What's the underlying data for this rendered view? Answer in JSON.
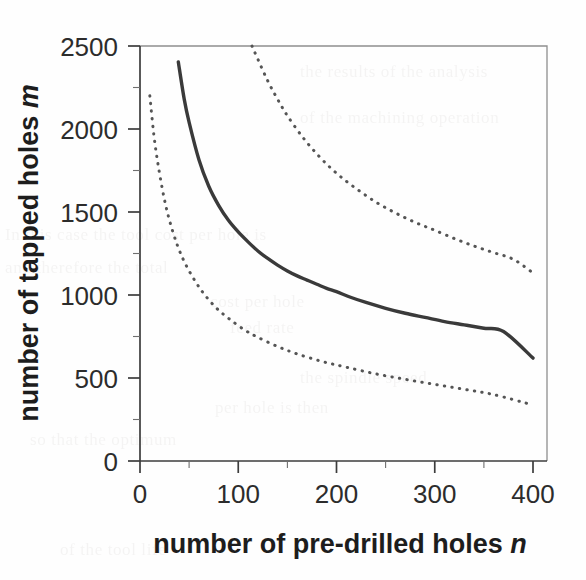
{
  "figure": {
    "name": "tapped-holes-vs-predrilled-holes-plot",
    "background_color": "#fefefe",
    "ink_color": "#3a3a3a"
  },
  "chart_data": {
    "type": "line",
    "title": "",
    "subtitle": "",
    "xlabel_text": "number of pre-drilled holes ",
    "xlabel_variable": "n",
    "ylabel_text": "number of tapped holes ",
    "ylabel_variable": "m",
    "xlim": [
      0,
      400
    ],
    "ylim": [
      0,
      2500
    ],
    "grid": false,
    "legend": "none",
    "x_ticks": [
      0,
      100,
      200,
      300,
      400
    ],
    "x_tick_labels": [
      "0",
      "100",
      "200",
      "300",
      "400"
    ],
    "x_minor_tick_step": 50,
    "y_ticks": [
      0,
      500,
      1000,
      1500,
      2000,
      2500
    ],
    "y_tick_labels": [
      "0",
      "500",
      "1000",
      "1500",
      "2000",
      "2500"
    ],
    "y_minor_tick_step": 250,
    "series": [
      {
        "name": "central estimate",
        "style": "solid",
        "color": "#3a3a3a",
        "x": [
          39,
          45,
          50,
          60,
          70,
          80,
          90,
          100,
          110,
          120,
          130,
          140,
          150,
          160,
          170,
          180,
          190,
          200,
          215,
          230,
          250,
          270,
          290,
          310,
          330,
          350,
          370,
          400
        ],
        "y": [
          2404,
          2180,
          2040,
          1815,
          1655,
          1540,
          1450,
          1380,
          1320,
          1265,
          1220,
          1180,
          1145,
          1115,
          1090,
          1065,
          1040,
          1020,
          985,
          955,
          920,
          890,
          865,
          840,
          820,
          800,
          780,
          620
        ]
      },
      {
        "name": "upper bound",
        "style": "dotted",
        "color": "#555555",
        "x": [
          114,
          120,
          130,
          140,
          150,
          165,
          180,
          195,
          210,
          225,
          240,
          255,
          270,
          285,
          300,
          320,
          340,
          360,
          380,
          400
        ],
        "y": [
          2500,
          2420,
          2290,
          2180,
          2080,
          1955,
          1850,
          1760,
          1685,
          1620,
          1560,
          1510,
          1465,
          1425,
          1390,
          1340,
          1295,
          1255,
          1215,
          1133
        ]
      },
      {
        "name": "lower bound",
        "style": "dotted",
        "color": "#555555",
        "x": [
          10,
          14,
          18,
          24,
          30,
          38,
          46,
          56,
          66,
          78,
          90,
          105,
          120,
          140,
          160,
          185,
          210,
          240,
          270,
          300,
          330,
          360,
          400
        ],
        "y": [
          2200,
          1970,
          1800,
          1600,
          1450,
          1300,
          1190,
          1085,
          1000,
          920,
          860,
          795,
          745,
          690,
          645,
          600,
          565,
          525,
          492,
          462,
          432,
          400,
          337
        ]
      }
    ]
  },
  "annotations": {
    "bleed_through": [
      "the results of the analysis",
      "of the machining operation",
      "In this case the tool cost per hole is",
      "and therefore the total",
      "cost per hole",
      "feed rate",
      "the spindle speed",
      "per hole is then",
      "so that the optimum",
      "of the tool life"
    ]
  }
}
